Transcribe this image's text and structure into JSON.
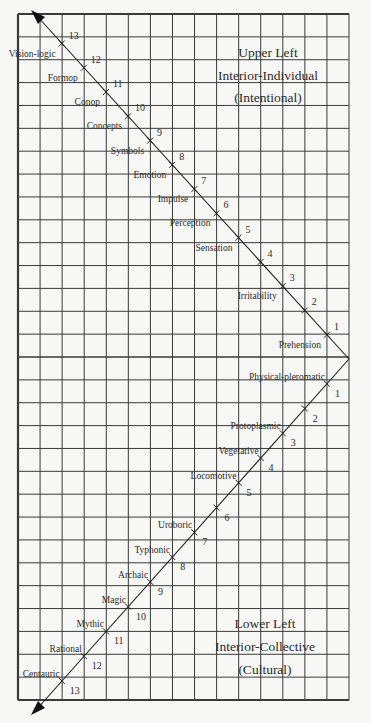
{
  "diagram": {
    "title": "",
    "grid": {
      "columns": 15,
      "rows": 30
    },
    "upper_quadrant": {
      "line1": "Upper Left",
      "line2": "Interior-Individual",
      "line3": "(Intentional)"
    },
    "lower_quadrant": {
      "line1": "Lower Left",
      "line2": "Interior-Collective",
      "line3": "(Cultural)"
    },
    "upper_stages": [
      {
        "num": "1",
        "label": "Prehension"
      },
      {
        "num": "2",
        "label": ""
      },
      {
        "num": "3",
        "label": "Irritability"
      },
      {
        "num": "4",
        "label": ""
      },
      {
        "num": "5",
        "label": "Sensation"
      },
      {
        "num": "6",
        "label": "Perception"
      },
      {
        "num": "7",
        "label": "Impulse"
      },
      {
        "num": "8",
        "label": "Emotion"
      },
      {
        "num": "9",
        "label": "Symbols"
      },
      {
        "num": "10",
        "label": "Concepts"
      },
      {
        "num": "11",
        "label": "Conop"
      },
      {
        "num": "12",
        "label": "Formop"
      },
      {
        "num": "13",
        "label": "Vision-logic"
      }
    ],
    "lower_stages": [
      {
        "num": "1",
        "label": "Physical-pleromatic"
      },
      {
        "num": "2",
        "label": ""
      },
      {
        "num": "3",
        "label": "Protoplasmic"
      },
      {
        "num": "4",
        "label": "Vegetative"
      },
      {
        "num": "5",
        "label": "Locomotive"
      },
      {
        "num": "6",
        "label": ""
      },
      {
        "num": "7",
        "label": "Uroboric"
      },
      {
        "num": "8",
        "label": "Typhonic"
      },
      {
        "num": "9",
        "label": "Archaic"
      },
      {
        "num": "10",
        "label": "Magic"
      },
      {
        "num": "11",
        "label": "Mythic"
      },
      {
        "num": "12",
        "label": "Rational"
      },
      {
        "num": "13",
        "label": "Centauric"
      }
    ],
    "colors": {
      "background": "#f7f7f5",
      "grid": "#3a3a3a",
      "text": "#2b2b2b"
    }
  }
}
